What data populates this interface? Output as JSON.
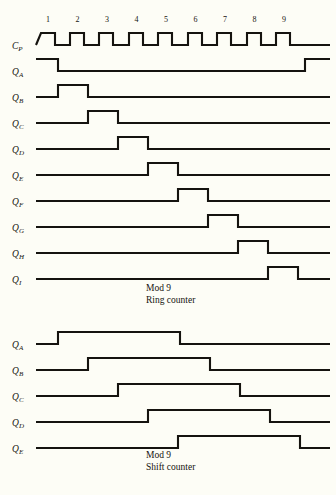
{
  "page": {
    "background_color": "#fdfdf6",
    "ink_color": "#15130f",
    "width": 336,
    "height": 495
  },
  "figures": [
    {
      "id": "ring",
      "caption_line1": "Mod 9",
      "caption_line2": "Ring counter",
      "caption_x": 146,
      "caption_y1": 291,
      "caption_y2": 303,
      "cycle_numbers": [
        "1",
        "2",
        "3",
        "4",
        "5",
        "6",
        "7",
        "8",
        "9"
      ],
      "cycle_number_y": 22,
      "label_x": 12,
      "trace_x_start": 36,
      "trace_x_end": 330,
      "cycle_width": 29.5,
      "amplitude": 12,
      "signals": [
        {
          "name": "C",
          "sub": "P",
          "label_y": 45,
          "baseline_y": 45,
          "transitions": [
            [
              36,
              0
            ],
            [
              41,
              1
            ],
            [
              55,
              1
            ],
            [
              55,
              0
            ],
            [
              70,
              0
            ],
            [
              70,
              1
            ],
            [
              84,
              1
            ],
            [
              84,
              0
            ],
            [
              99,
              0
            ],
            [
              99,
              1
            ],
            [
              113,
              1
            ],
            [
              113,
              0
            ],
            [
              129,
              0
            ],
            [
              129,
              1
            ],
            [
              143,
              1
            ],
            [
              143,
              0
            ],
            [
              158,
              0
            ],
            [
              158,
              1
            ],
            [
              172,
              1
            ],
            [
              172,
              0
            ],
            [
              188,
              0
            ],
            [
              188,
              1
            ],
            [
              202,
              1
            ],
            [
              202,
              0
            ],
            [
              217,
              0
            ],
            [
              217,
              1
            ],
            [
              231,
              1
            ],
            [
              231,
              0
            ],
            [
              247,
              0
            ],
            [
              247,
              1
            ],
            [
              261,
              1
            ],
            [
              261,
              0
            ],
            [
              276,
              0
            ],
            [
              276,
              1
            ],
            [
              290,
              1
            ],
            [
              290,
              0
            ],
            [
              330,
              0
            ]
          ]
        },
        {
          "name": "Q",
          "sub": "A",
          "label_y": 71,
          "baseline_y": 71,
          "transitions": [
            [
              36,
              1
            ],
            [
              58,
              1
            ],
            [
              58,
              0
            ],
            [
              305,
              0
            ],
            [
              305,
              1
            ],
            [
              330,
              1
            ]
          ]
        },
        {
          "name": "Q",
          "sub": "B",
          "label_y": 97,
          "baseline_y": 97,
          "transitions": [
            [
              36,
              0
            ],
            [
              58,
              0
            ],
            [
              58,
              1
            ],
            [
              88,
              1
            ],
            [
              88,
              0
            ],
            [
              330,
              0
            ]
          ]
        },
        {
          "name": "Q",
          "sub": "C",
          "label_y": 123,
          "baseline_y": 123,
          "transitions": [
            [
              36,
              0
            ],
            [
              88,
              0
            ],
            [
              88,
              1
            ],
            [
              118,
              1
            ],
            [
              118,
              0
            ],
            [
              330,
              0
            ]
          ]
        },
        {
          "name": "Q",
          "sub": "D",
          "label_y": 149,
          "baseline_y": 149,
          "transitions": [
            [
              36,
              0
            ],
            [
              118,
              0
            ],
            [
              118,
              1
            ],
            [
              148,
              1
            ],
            [
              148,
              0
            ],
            [
              330,
              0
            ]
          ]
        },
        {
          "name": "Q",
          "sub": "E",
          "label_y": 175,
          "baseline_y": 175,
          "transitions": [
            [
              36,
              0
            ],
            [
              148,
              0
            ],
            [
              148,
              1
            ],
            [
              178,
              1
            ],
            [
              178,
              0
            ],
            [
              330,
              0
            ]
          ]
        },
        {
          "name": "Q",
          "sub": "F",
          "label_y": 201,
          "baseline_y": 201,
          "transitions": [
            [
              36,
              0
            ],
            [
              178,
              0
            ],
            [
              178,
              1
            ],
            [
              208,
              1
            ],
            [
              208,
              0
            ],
            [
              330,
              0
            ]
          ]
        },
        {
          "name": "Q",
          "sub": "G",
          "label_y": 227,
          "baseline_y": 227,
          "transitions": [
            [
              36,
              0
            ],
            [
              208,
              0
            ],
            [
              208,
              1
            ],
            [
              238,
              1
            ],
            [
              238,
              0
            ],
            [
              330,
              0
            ]
          ]
        },
        {
          "name": "Q",
          "sub": "H",
          "label_y": 253,
          "baseline_y": 253,
          "transitions": [
            [
              36,
              0
            ],
            [
              238,
              0
            ],
            [
              238,
              1
            ],
            [
              268,
              1
            ],
            [
              268,
              0
            ],
            [
              330,
              0
            ]
          ]
        },
        {
          "name": "Q",
          "sub": "I",
          "label_y": 279,
          "baseline_y": 279,
          "transitions": [
            [
              36,
              0
            ],
            [
              268,
              0
            ],
            [
              268,
              1
            ],
            [
              298,
              1
            ],
            [
              298,
              0
            ],
            [
              330,
              0
            ]
          ]
        }
      ]
    },
    {
      "id": "shift",
      "caption_line1": "Mod 9",
      "caption_line2": "Shift counter",
      "caption_x": 146,
      "caption_y1": 148,
      "caption_y2": 160,
      "cycle_numbers": [],
      "cycle_number_y": 0,
      "label_x": 12,
      "trace_x_start": 36,
      "trace_x_end": 330,
      "cycle_width": 29.5,
      "amplitude": 12,
      "signals": [
        {
          "name": "Q",
          "sub": "A",
          "label_y": 34,
          "baseline_y": 34,
          "transitions": [
            [
              36,
              0
            ],
            [
              58,
              0
            ],
            [
              58,
              1
            ],
            [
              180,
              1
            ],
            [
              180,
              0
            ],
            [
              330,
              0
            ]
          ]
        },
        {
          "name": "Q",
          "sub": "B",
          "label_y": 60,
          "baseline_y": 60,
          "transitions": [
            [
              36,
              0
            ],
            [
              88,
              0
            ],
            [
              88,
              1
            ],
            [
              210,
              1
            ],
            [
              210,
              0
            ],
            [
              330,
              0
            ]
          ]
        },
        {
          "name": "Q",
          "sub": "C",
          "label_y": 86,
          "baseline_y": 86,
          "transitions": [
            [
              36,
              0
            ],
            [
              118,
              0
            ],
            [
              118,
              1
            ],
            [
              240,
              1
            ],
            [
              240,
              0
            ],
            [
              330,
              0
            ]
          ]
        },
        {
          "name": "Q",
          "sub": "D",
          "label_y": 112,
          "baseline_y": 112,
          "transitions": [
            [
              36,
              0
            ],
            [
              148,
              0
            ],
            [
              148,
              1
            ],
            [
              270,
              1
            ],
            [
              270,
              0
            ],
            [
              330,
              0
            ]
          ]
        },
        {
          "name": "Q",
          "sub": "E",
          "label_y": 138,
          "baseline_y": 138,
          "transitions": [
            [
              36,
              0
            ],
            [
              178,
              0
            ],
            [
              178,
              1
            ],
            [
              300,
              1
            ],
            [
              300,
              0
            ],
            [
              330,
              0
            ]
          ]
        }
      ]
    }
  ]
}
